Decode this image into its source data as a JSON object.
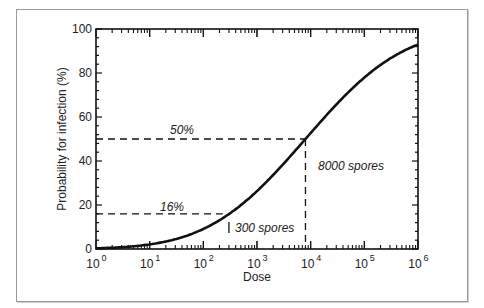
{
  "chart_data": {
    "type": "line",
    "title": "",
    "xlabel": "Dose",
    "ylabel": "Probability for infection (%)",
    "xscale": "log",
    "xlim": [
      1,
      1000000
    ],
    "ylim": [
      0,
      100
    ],
    "x_tick_labels": [
      "10^0",
      "10^1",
      "10^2",
      "10^3",
      "10^4",
      "10^5",
      "10^6"
    ],
    "y_tick_labels": [
      "0",
      "20",
      "40",
      "60",
      "80",
      "100"
    ],
    "grid": false,
    "legend": null,
    "series": [
      {
        "name": "Dose-response (log-normal)",
        "x": [
          1,
          10,
          100,
          300,
          1000,
          8000,
          10000,
          100000,
          1000000
        ],
        "values": [
          0.3,
          2.2,
          9.5,
          16,
          25,
          50,
          53,
          78,
          93
        ]
      }
    ],
    "annotations": [
      {
        "text": "50%",
        "y": 50,
        "x_end": 8000,
        "style": "dashed"
      },
      {
        "text": "16%",
        "y": 16,
        "x_end": 300,
        "style": "dashed"
      },
      {
        "text": "8000 spores",
        "x": 8000,
        "y_end": 50,
        "style": "dashed"
      },
      {
        "text": "300 spores",
        "x": 300,
        "style": "tick"
      }
    ]
  },
  "labels": {
    "x_axis": "Dose",
    "y_axis": "Probability for infection (%)",
    "ann_50": "50%",
    "ann_16": "16%",
    "ann_8000": "8000 spores",
    "ann_300": "300 spores",
    "y_ticks": [
      "0",
      "20",
      "40",
      "60",
      "80",
      "100"
    ],
    "x_base": "10",
    "x_exps": [
      "0",
      "1",
      "2",
      "3",
      "4",
      "5",
      "6"
    ]
  }
}
